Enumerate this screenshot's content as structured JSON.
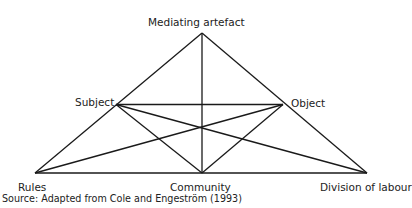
{
  "figure": {
    "cropped_caption": "Figure — Activity theory triangle",
    "nodes": {
      "apex": {
        "label": "Mediating artefact",
        "x": 202,
        "y": 33
      },
      "subject": {
        "label": "Subject",
        "x": 116,
        "y": 104.5
      },
      "object": {
        "label": "Object",
        "x": 283,
        "y": 104.5
      },
      "rules": {
        "label": "Rules",
        "x": 35,
        "y": 173
      },
      "community": {
        "label": "Community",
        "x": 202,
        "y": 173
      },
      "division": {
        "label": "Division of labour",
        "x": 367,
        "y": 173
      }
    },
    "source": "Source: Adapted from Cole and Engeström (1993)",
    "line_color": "#1a1a1a"
  }
}
